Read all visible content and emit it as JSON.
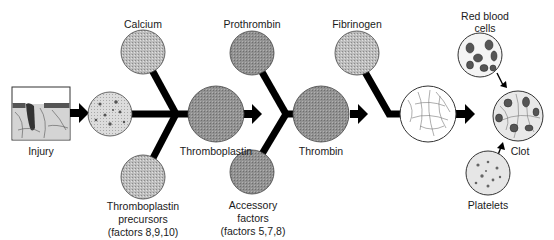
{
  "diagram": {
    "colors": {
      "line": "#000000",
      "dark_circle": "#8e8e8e",
      "mid_circle": "#b5b5b5",
      "light_circle": "#d6d6d6",
      "fibrin_circle": "#ffffff",
      "text": "#1a1a1a"
    },
    "nodes": {
      "injury": {
        "label": "Injury"
      },
      "calcium": {
        "label": "Calcium"
      },
      "tissue": {
        "label": ""
      },
      "precursors": {
        "line1": "Thromboplastin",
        "line2": "precursors",
        "line3": "(factors 8,9,10)"
      },
      "thromboplastin": {
        "label": "Thromboplastin"
      },
      "prothrombin": {
        "label": "Prothrombin"
      },
      "accessory": {
        "line1": "Accessory",
        "line2": "factors",
        "line3": "(factors 5,7,8)"
      },
      "thrombin": {
        "label": "Thrombin"
      },
      "fibrinogen": {
        "label": "Fibrinogen"
      },
      "fibrin": {
        "label": ""
      },
      "red_blood_cells": {
        "line1": "Red blood",
        "line2": "cells"
      },
      "clot": {
        "label": "Clot"
      },
      "platelets": {
        "label": "Platelets"
      }
    },
    "edges": [
      [
        "injury",
        "tissue"
      ],
      [
        "calcium",
        "thromboplastin"
      ],
      [
        "tissue",
        "thromboplastin"
      ],
      [
        "precursors",
        "thromboplastin"
      ],
      [
        "thromboplastin",
        "thrombin"
      ],
      [
        "prothrombin",
        "thrombin"
      ],
      [
        "accessory",
        "thrombin"
      ],
      [
        "thrombin",
        "fibrin"
      ],
      [
        "fibrinogen",
        "fibrin"
      ],
      [
        "fibrin",
        "clot"
      ],
      [
        "red_blood_cells",
        "clot"
      ],
      [
        "platelets",
        "clot"
      ]
    ]
  }
}
